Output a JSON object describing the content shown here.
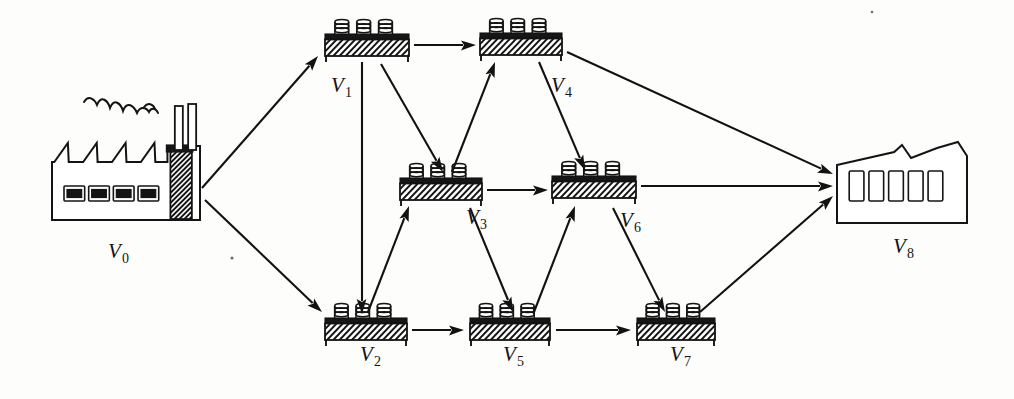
{
  "diagram": {
    "ink_color": "#141414",
    "background_color": "#fdfdfc",
    "nodes": [
      {
        "id": "V0",
        "label": "V",
        "sub": "0",
        "kind": "factory-icon",
        "label_x": 108,
        "label_y": 258,
        "x": 52,
        "y": 140,
        "w": 148,
        "h": 80
      },
      {
        "id": "V1",
        "label": "V",
        "sub": "1",
        "kind": "pallet-slab",
        "label_x": 331,
        "label_y": 92,
        "x": 325,
        "y": 34,
        "w": 84,
        "h": 22
      },
      {
        "id": "V2",
        "label": "V",
        "sub": "2",
        "kind": "pallet-slab",
        "label_x": 360,
        "label_y": 361,
        "x": 325,
        "y": 318,
        "w": 82,
        "h": 22
      },
      {
        "id": "V3",
        "label": "V",
        "sub": "3",
        "kind": "pallet-slab",
        "label_x": 466,
        "label_y": 224,
        "x": 400,
        "y": 178,
        "w": 82,
        "h": 22
      },
      {
        "id": "V4",
        "label": "V",
        "sub": "4",
        "kind": "pallet-slab",
        "label_x": 551,
        "label_y": 92,
        "x": 480,
        "y": 33,
        "w": 82,
        "h": 22
      },
      {
        "id": "V5",
        "label": "V",
        "sub": "5",
        "kind": "pallet-slab",
        "label_x": 503,
        "label_y": 361,
        "x": 470,
        "y": 318,
        "w": 80,
        "h": 22
      },
      {
        "id": "V6",
        "label": "V",
        "sub": "6",
        "kind": "pallet-slab",
        "label_x": 620,
        "label_y": 227,
        "x": 552,
        "y": 176,
        "w": 84,
        "h": 22
      },
      {
        "id": "V7",
        "label": "V",
        "sub": "7",
        "kind": "pallet-slab",
        "label_x": 670,
        "label_y": 361,
        "x": 637,
        "y": 318,
        "w": 78,
        "h": 22
      },
      {
        "id": "V8",
        "label": "V",
        "sub": "8",
        "kind": "warehouse-icon",
        "label_x": 893,
        "label_y": 253,
        "x": 837,
        "y": 145,
        "w": 130,
        "h": 78
      }
    ],
    "edges": [
      {
        "from": "V0",
        "to": "V1",
        "x1": 202,
        "y1": 188,
        "x2": 318,
        "y2": 56
      },
      {
        "from": "V0",
        "to": "V2",
        "x1": 205,
        "y1": 200,
        "x2": 322,
        "y2": 312
      },
      {
        "from": "V1",
        "to": "V4",
        "x1": 414,
        "y1": 45,
        "x2": 476,
        "y2": 45
      },
      {
        "from": "V1",
        "to": "V2",
        "x1": 362,
        "y1": 62,
        "x2": 362,
        "y2": 314
      },
      {
        "from": "V1",
        "to": "V3",
        "x1": 381,
        "y1": 64,
        "x2": 443,
        "y2": 172
      },
      {
        "from": "V2",
        "to": "V3",
        "x1": 368,
        "y1": 312,
        "x2": 409,
        "y2": 206
      },
      {
        "from": "V2",
        "to": "V5",
        "x1": 412,
        "y1": 330,
        "x2": 464,
        "y2": 330
      },
      {
        "from": "V3",
        "to": "V4",
        "x1": 452,
        "y1": 172,
        "x2": 495,
        "y2": 62
      },
      {
        "from": "V3",
        "to": "V6",
        "x1": 487,
        "y1": 190,
        "x2": 548,
        "y2": 190
      },
      {
        "from": "V3",
        "to": "V5",
        "x1": 470,
        "y1": 208,
        "x2": 513,
        "y2": 312
      },
      {
        "from": "V4",
        "to": "V6",
        "x1": 539,
        "y1": 62,
        "x2": 585,
        "y2": 170
      },
      {
        "from": "V4",
        "to": "V8",
        "x1": 567,
        "y1": 52,
        "x2": 833,
        "y2": 174
      },
      {
        "from": "V5",
        "to": "V6",
        "x1": 534,
        "y1": 312,
        "x2": 575,
        "y2": 206
      },
      {
        "from": "V5",
        "to": "V7",
        "x1": 556,
        "y1": 330,
        "x2": 631,
        "y2": 330
      },
      {
        "from": "V6",
        "to": "V7",
        "x1": 613,
        "y1": 208,
        "x2": 665,
        "y2": 312
      },
      {
        "from": "V6",
        "to": "V8",
        "x1": 641,
        "y1": 186,
        "x2": 833,
        "y2": 186
      },
      {
        "from": "V7",
        "to": "V8",
        "x1": 700,
        "y1": 312,
        "x2": 833,
        "y2": 196
      }
    ],
    "icons": {
      "factory": "factory-icon",
      "warehouse": "warehouse-icon",
      "pallet": "pallet-icon",
      "smoke": "smoke-icon",
      "arrow": "arrow-icon"
    },
    "factory_detail": {
      "roof_teeth": 4,
      "windows": 4,
      "smokestacks": 2
    },
    "warehouse_detail": {
      "windows": 5,
      "roof_peaks": 2
    },
    "pallet_detail": {
      "coin_stacks": 3,
      "coins_per_stack": 3
    }
  }
}
